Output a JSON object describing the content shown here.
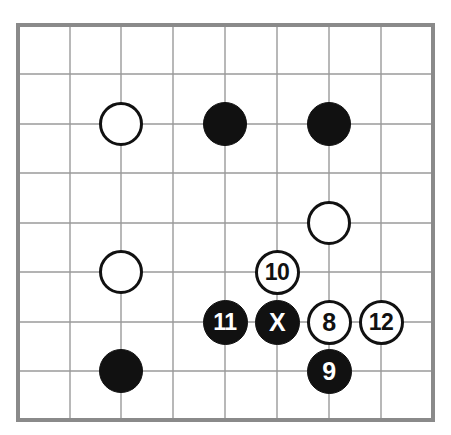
{
  "figure": {
    "kind": "go-board-diagram",
    "board_size": 9,
    "background_color": "#ffffff",
    "border_color": "#8a8a8a",
    "grid_line_color": "#9a9a9a",
    "black_stone_color": "#111111",
    "white_stone_color": "#ffffff",
    "stone_outline_color": "#111111"
  },
  "board": {
    "left": 18,
    "top": 25,
    "right": 433,
    "bottom": 420,
    "cols": 9,
    "rows": 9,
    "col_x": [
      18,
      70,
      121,
      173,
      225,
      277,
      329,
      381,
      433
    ],
    "row_y": [
      25,
      74,
      124,
      173,
      223,
      272,
      322,
      371,
      420
    ],
    "stone_diameter": 44,
    "numbered_stone_diameter": 45
  },
  "stones": [
    {
      "label": "",
      "color": "white",
      "col": 2,
      "row": 2,
      "numbered": false,
      "name": "stone-white-c2r2"
    },
    {
      "label": "",
      "color": "black",
      "col": 4,
      "row": 2,
      "numbered": false,
      "name": "stone-black-c4r2"
    },
    {
      "label": "",
      "color": "black",
      "col": 6,
      "row": 2,
      "numbered": false,
      "name": "stone-black-c6r2"
    },
    {
      "label": "",
      "color": "white",
      "col": 6,
      "row": 4,
      "numbered": false,
      "name": "stone-white-c6r4"
    },
    {
      "label": "",
      "color": "white",
      "col": 2,
      "row": 5,
      "numbered": false,
      "name": "stone-white-c2r5"
    },
    {
      "label": "10",
      "color": "white",
      "col": 5,
      "row": 5,
      "numbered": true,
      "name": "stone-move-10"
    },
    {
      "label": "11",
      "color": "black",
      "col": 4,
      "row": 6,
      "numbered": true,
      "name": "stone-move-11"
    },
    {
      "label": "X",
      "color": "black",
      "col": 5,
      "row": 6,
      "numbered": true,
      "name": "stone-move-x"
    },
    {
      "label": "8",
      "color": "white",
      "col": 6,
      "row": 6,
      "numbered": true,
      "name": "stone-move-8"
    },
    {
      "label": "12",
      "color": "white",
      "col": 7,
      "row": 6,
      "numbered": true,
      "name": "stone-move-12"
    },
    {
      "label": "",
      "color": "black",
      "col": 2,
      "row": 7,
      "numbered": false,
      "name": "stone-black-c2r7"
    },
    {
      "label": "9",
      "color": "black",
      "col": 6,
      "row": 7,
      "numbered": true,
      "name": "stone-move-9"
    }
  ]
}
